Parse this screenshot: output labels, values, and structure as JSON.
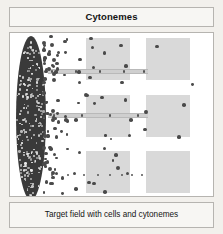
{
  "header": {
    "title": "Cytonemes"
  },
  "footer": {
    "caption": "Target field with cells and cytonemes"
  },
  "colors": {
    "card_background": "#f2f0ec",
    "panel_background": "#ffffff",
    "border": "#b6b4b0",
    "source_field": "#3a3a3a",
    "target_square": "#d9d9d9",
    "cell_dot": "#4a4a4a",
    "cytoneme_bar": "#cfcfcf",
    "text": "#141414"
  },
  "diagram": {
    "source_field": {
      "label": "source-cell-field",
      "shape": "ellipse",
      "x": 6,
      "y": 3,
      "width": 30,
      "height": 164,
      "packed_dot_count": 210
    },
    "target_squares": [
      {
        "label": "target-field-row1-near",
        "x": 76,
        "y": 5,
        "width": 44,
        "height": 42
      },
      {
        "label": "target-field-row1-far",
        "x": 136,
        "y": 5,
        "width": 44,
        "height": 42
      },
      {
        "label": "target-field-row2-near",
        "x": 76,
        "y": 62,
        "width": 44,
        "height": 42
      },
      {
        "label": "target-field-row2-far",
        "x": 136,
        "y": 62,
        "width": 44,
        "height": 42
      },
      {
        "label": "target-field-row3-near",
        "x": 76,
        "y": 118,
        "width": 44,
        "height": 42
      },
      {
        "label": "target-field-row3-far",
        "x": 136,
        "y": 118,
        "width": 44,
        "height": 42
      }
    ],
    "cytonemes": [
      {
        "label": "cytoneme-row1",
        "style": "solid-bar",
        "x": 38,
        "y": 36,
        "width": 100,
        "height": 5,
        "dots": [
          4,
          28,
          52,
          76,
          96
        ]
      },
      {
        "label": "cytoneme-row2",
        "style": "solid-bar",
        "x": 38,
        "y": 80,
        "width": 100,
        "height": 5,
        "dots": [
          6,
          34,
          62,
          90
        ]
      },
      {
        "label": "cytoneme-row3",
        "style": "dotted-chain",
        "x": 38,
        "y": 140,
        "width": 100,
        "height": 4,
        "dots": [
          4,
          20,
          36,
          50,
          62,
          74,
          84,
          94
        ]
      }
    ],
    "scattered_cells": {
      "label": "scattered-cells",
      "description": "cells emanating rightward from the source field, density decreasing with distance",
      "count": 118
    }
  }
}
